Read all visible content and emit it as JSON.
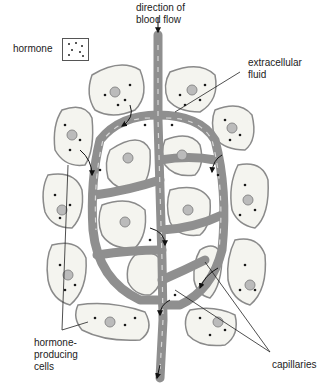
{
  "diagram": {
    "labels": {
      "direction": "direction of\nblood flow",
      "hormone": "hormone",
      "extracellular": "extracellular\nfluid",
      "producing": "hormone-\nproducing\ncells",
      "capillaries": "capillaries"
    },
    "legend": {
      "symbol": "dots",
      "meaning": "hormone"
    },
    "colors": {
      "vessel": "#8f8f8f",
      "vessel_highlight": "#d8d8d8",
      "cell_fill": "#f4f4ef",
      "cell_outline": "#8a8a8a",
      "nucleus": "#9a9a9a",
      "hormone_dot": "#1a1a1a",
      "text": "#222222"
    }
  }
}
